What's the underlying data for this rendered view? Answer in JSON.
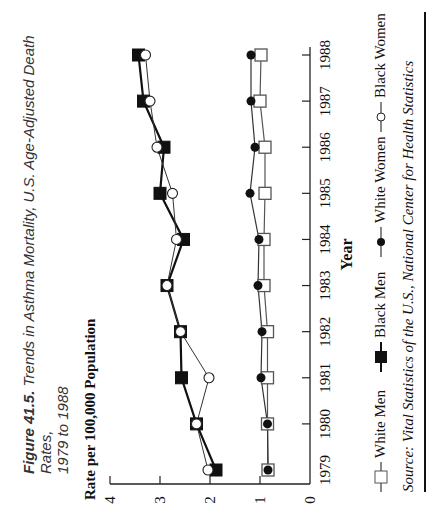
{
  "figure": {
    "number_label": "Figure 41.5.",
    "title_line1": "Trends in Asthma Mortality, U.S. Age-Adjusted Death Rates,",
    "title_line2": "1979 to 1988"
  },
  "source": "Source: Vital Statistics of the U.S.,  National Center for Health Statistics",
  "legend": [
    {
      "label": "White Men",
      "marker": "open-square"
    },
    {
      "label": "Black Men",
      "marker": "filled-square"
    },
    {
      "label": "White Women",
      "marker": "filled-circle"
    },
    {
      "label": "Black Women",
      "marker": "open-circle"
    }
  ],
  "chart_data": {
    "type": "line",
    "title": "Trends in Asthma Mortality, U.S. Age-Adjusted Death Rates, 1979 to 1988",
    "xlabel": "Year",
    "ylabel": "Rate per 100,000 Population",
    "x": [
      1979,
      1980,
      1981,
      1982,
      1983,
      1984,
      1985,
      1986,
      1987,
      1988
    ],
    "ylim": [
      0,
      4
    ],
    "yticks": [
      0,
      1,
      2,
      3,
      4
    ],
    "grid": false,
    "legend_position": "bottom",
    "orientation_note": "figure printed rotated 90 degrees counter-clockwise",
    "series": [
      {
        "name": "White Men",
        "marker": "open-square",
        "values": [
          0.84,
          0.85,
          0.85,
          0.85,
          0.92,
          0.92,
          0.9,
          0.9,
          1.0,
          0.98
        ]
      },
      {
        "name": "Black Men",
        "marker": "filled-square",
        "values": [
          1.88,
          2.27,
          2.57,
          2.59,
          2.86,
          2.53,
          3.0,
          2.92,
          3.33,
          3.43
        ]
      },
      {
        "name": "White Women",
        "marker": "filled-circle",
        "values": [
          0.84,
          0.85,
          0.98,
          0.96,
          1.04,
          1.02,
          1.2,
          1.1,
          1.18,
          1.18
        ]
      },
      {
        "name": "Black Women",
        "marker": "open-circle",
        "values": [
          2.04,
          2.27,
          2.02,
          2.59,
          2.86,
          2.67,
          2.75,
          3.06,
          3.2,
          3.29
        ]
      }
    ]
  }
}
